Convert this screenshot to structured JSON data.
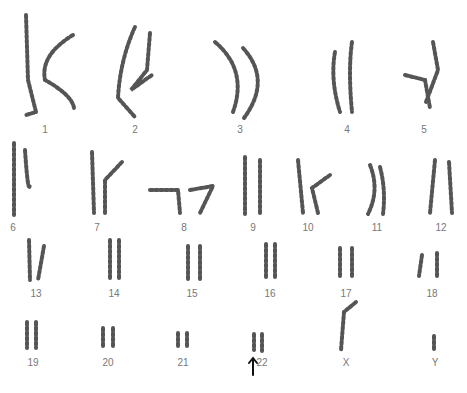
{
  "figure": {
    "type": "karyotype"
  },
  "labels": [
    {
      "t": "1",
      "x": 45,
      "y": 124
    },
    {
      "t": "2",
      "x": 135,
      "y": 124
    },
    {
      "t": "3",
      "x": 240,
      "y": 124
    },
    {
      "t": "4",
      "x": 347,
      "y": 124
    },
    {
      "t": "5",
      "x": 424,
      "y": 124
    },
    {
      "t": "6",
      "x": 13,
      "y": 222
    },
    {
      "t": "7",
      "x": 97,
      "y": 222
    },
    {
      "t": "8",
      "x": 184,
      "y": 222
    },
    {
      "t": "9",
      "x": 253,
      "y": 222
    },
    {
      "t": "10",
      "x": 308,
      "y": 222
    },
    {
      "t": "11",
      "x": 377,
      "y": 222
    },
    {
      "t": "12",
      "x": 441,
      "y": 222
    },
    {
      "t": "13",
      "x": 36,
      "y": 288
    },
    {
      "t": "14",
      "x": 114,
      "y": 288
    },
    {
      "t": "15",
      "x": 192,
      "y": 288
    },
    {
      "t": "16",
      "x": 270,
      "y": 288
    },
    {
      "t": "17",
      "x": 346,
      "y": 288
    },
    {
      "t": "18",
      "x": 432,
      "y": 288
    },
    {
      "t": "19",
      "x": 33,
      "y": 357
    },
    {
      "t": "20",
      "x": 108,
      "y": 357
    },
    {
      "t": "21",
      "x": 183,
      "y": 357
    },
    {
      "t": "22",
      "x": 262,
      "y": 357
    },
    {
      "t": "X",
      "x": 346,
      "y": 357
    },
    {
      "t": "Y",
      "x": 435,
      "y": 357
    }
  ],
  "annotation": {
    "arrow_at": "22"
  }
}
